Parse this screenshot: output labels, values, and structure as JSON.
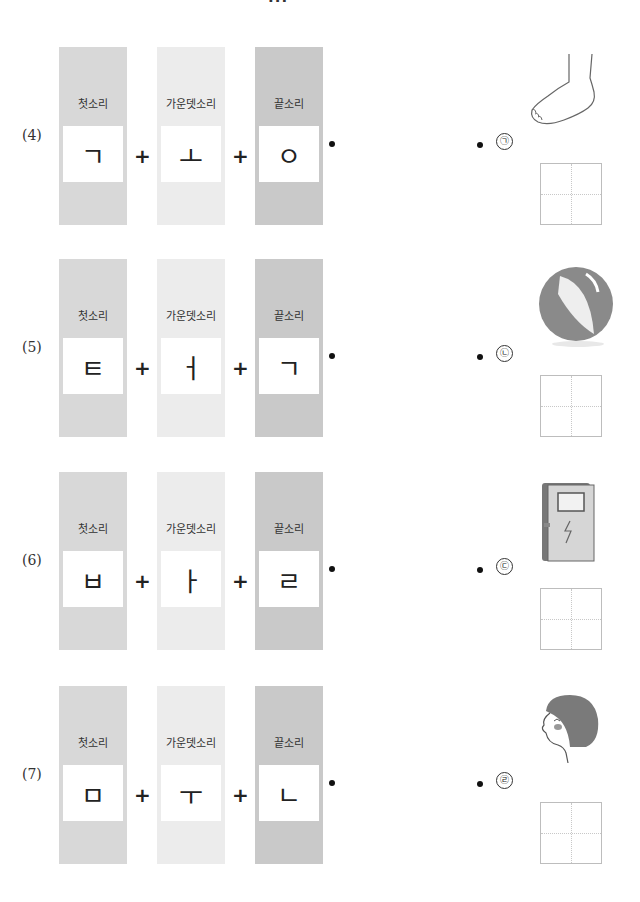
{
  "header": {
    "clipped_text": "···"
  },
  "column_labels": {
    "initial": "첫소리",
    "medial": "가운뎃소리",
    "final": "끝소리"
  },
  "operator": "+",
  "problems": [
    {
      "number": "(4)",
      "initial": "ㄱ",
      "medial": "ㅗ",
      "final": "ㅇ",
      "choice_label": "㉠",
      "picture": "foot"
    },
    {
      "number": "(5)",
      "initial": "ㅌ",
      "medial": "ㅓ",
      "final": "ㄱ",
      "choice_label": "㉡",
      "picture": "beach-ball"
    },
    {
      "number": "(6)",
      "initial": "ㅂ",
      "medial": "ㅏ",
      "final": "ㄹ",
      "choice_label": "㉢",
      "picture": "electrical-cabinet"
    },
    {
      "number": "(7)",
      "initial": "ㅁ",
      "medial": "ㅜ",
      "final": "ㄴ",
      "choice_label": "㉣",
      "picture": "girl-face"
    }
  ],
  "colors": {
    "initial_col": "#d8d8d8",
    "medial_col": "#ececec",
    "final_col": "#c9c9c9"
  }
}
